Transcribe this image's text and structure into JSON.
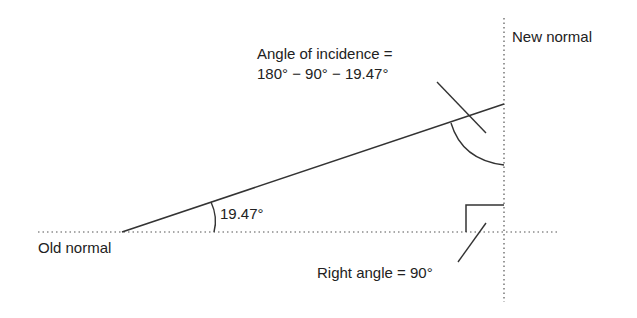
{
  "labels": {
    "new_normal": "New normal",
    "old_normal": "Old normal",
    "incidence_line1": "Angle of incidence =",
    "incidence_line2": "180° − 90° − 19.47°",
    "small_angle": "19.47°",
    "right_angle": "Right angle = 90°"
  },
  "colors": {
    "line": "#333333",
    "dotted": "#555555",
    "background": "#ffffff"
  },
  "geometry": {
    "old_normal_y": 232,
    "new_normal_x": 504,
    "ray_start": [
      122,
      232
    ],
    "ray_end": [
      504,
      104
    ],
    "angle_deg": 19.47
  }
}
